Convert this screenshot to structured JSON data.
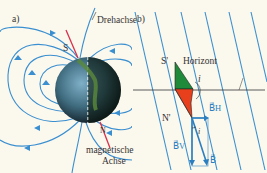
{
  "panel_a": {
    "label": "a)",
    "rotation_axis_label": "Drehachse",
    "magnetic_axis_label_line1": "magnetische",
    "magnetic_axis_label_line2": "Achse",
    "pole_top": "S",
    "pole_bottom": "N"
  },
  "panel_b": {
    "label": "b)",
    "horizon_label": "Horizont",
    "needle_top": "S'",
    "needle_bottom": "N'",
    "angle_label": "i",
    "angle_label_2": "i",
    "vector_horizontal": "B⃗H",
    "vector_vertical": "B⃗V",
    "vector_total": "B⃗"
  },
  "colors": {
    "field_lines": "#3a8fd0",
    "magnetic_axis": "#d8304a",
    "needle_green": "#1f8a3a",
    "needle_red": "#e8401c",
    "background": "#fbf8ee"
  }
}
